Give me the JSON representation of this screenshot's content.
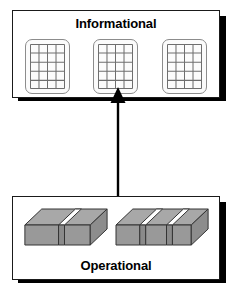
{
  "diagram": {
    "type": "layered-architecture",
    "background_color": "#ffffff",
    "orientation": "vertical"
  },
  "informational": {
    "title": "Informational",
    "icon_type": "table-grid-icon",
    "icon_count": 3,
    "icons": [
      {
        "name": "table-icon-1",
        "columns": 4,
        "rows": 5
      },
      {
        "name": "table-icon-2",
        "columns": 4,
        "rows": 5
      },
      {
        "name": "table-icon-3",
        "columns": 4,
        "rows": 5
      }
    ],
    "border_color": "#1a1a1a",
    "fill_color": "#ffffff",
    "shadow_color": "#000000"
  },
  "operational": {
    "title": "Operational",
    "icon_type": "3d-block-icon",
    "block_count": 2,
    "blocks": [
      {
        "name": "operational-block-left",
        "notches": 1
      },
      {
        "name": "operational-block-right",
        "notches": 2
      }
    ],
    "block_face_color": "#999999",
    "block_top_color": "#a6a6a6",
    "block_side_color": "#8f8f8f",
    "border_color": "#1a1a1a",
    "fill_color": "#ffffff",
    "shadow_color": "#000000"
  },
  "arrow": {
    "name": "flow-arrow",
    "direction": "up",
    "from": "Operational",
    "to": "Informational",
    "color": "#000000"
  }
}
